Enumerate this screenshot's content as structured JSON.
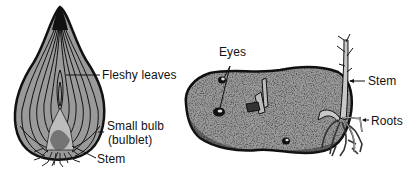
{
  "figure": {
    "panels": [
      {
        "id": "onion",
        "subject": "Onion bulb (longitudinal section)",
        "labels": [
          {
            "text": "Fleshy leaves"
          },
          {
            "text": "Small bulb"
          },
          {
            "text": "(bulblet)"
          },
          {
            "text": "Stem"
          }
        ]
      },
      {
        "id": "potato",
        "subject": "Potato tuber with sprout",
        "labels": [
          {
            "text": "Eyes"
          },
          {
            "text": "Stem"
          },
          {
            "text": "Roots"
          }
        ]
      }
    ],
    "colors": {
      "fill_gray": "#9a9a9a",
      "outline": "#111111",
      "speckle": "#3a3a3a",
      "background": "#ffffff"
    }
  }
}
